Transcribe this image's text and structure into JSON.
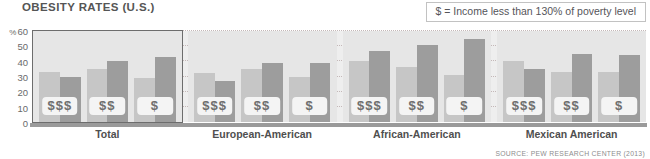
{
  "chart_data": {
    "type": "bar",
    "title": "OBESITY RATES (U.S.)",
    "xlabel": "",
    "ylabel": "%",
    "ylim": [
      0,
      60
    ],
    "yticks": [
      0,
      10,
      20,
      30,
      40,
      50,
      60
    ],
    "grid": true,
    "legend_position": "top-right",
    "legend": [
      {
        "label": "$ = Income less than 130% of poverty level"
      }
    ],
    "annotations": {
      "income_note": "$ = Income less than 130% of poverty level",
      "source": "SOURCE: PEW RESEARCH CENTER (2013)"
    },
    "series": [
      {
        "name": "light",
        "color": "#c6c6c6"
      },
      {
        "name": "dark",
        "color": "#9d9d9d"
      }
    ],
    "income_levels": [
      "$$$",
      "$$",
      "$"
    ],
    "categories": [
      "Total",
      "European-American",
      "African-American",
      "Mexican American"
    ],
    "groups": [
      {
        "label": "Total",
        "highlight": true,
        "pairs": [
          {
            "income": "$$$",
            "light": 33,
            "dark": 30
          },
          {
            "income": "$$",
            "light": 35,
            "dark": 40
          },
          {
            "income": "$",
            "light": 29,
            "dark": 43
          }
        ]
      },
      {
        "label": "European-American",
        "highlight": false,
        "pairs": [
          {
            "income": "$$$",
            "light": 32,
            "dark": 27
          },
          {
            "income": "$$",
            "light": 35,
            "dark": 39
          },
          {
            "income": "$",
            "light": 30,
            "dark": 39
          }
        ]
      },
      {
        "label": "African-American",
        "highlight": false,
        "pairs": [
          {
            "income": "$$$",
            "light": 40,
            "dark": 47
          },
          {
            "income": "$$",
            "light": 36,
            "dark": 51
          },
          {
            "income": "$",
            "light": 31,
            "dark": 55
          }
        ]
      },
      {
        "label": "Mexican American",
        "highlight": false,
        "pairs": [
          {
            "income": "$$$",
            "light": 40,
            "dark": 35
          },
          {
            "income": "$$",
            "light": 33,
            "dark": 45
          },
          {
            "income": "$",
            "light": 33,
            "dark": 44
          }
        ]
      }
    ]
  },
  "title": "OBESITY RATES (U.S.)",
  "legend_text": "$ = Income less than 130% of poverty level",
  "source_text": "SOURCE: PEW RESEARCH CENTER (2013)",
  "y_unit": "%"
}
